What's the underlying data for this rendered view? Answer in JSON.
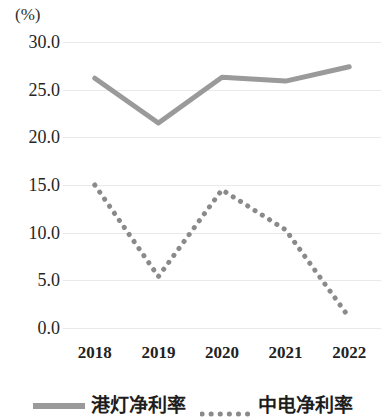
{
  "chart_data": {
    "type": "line",
    "title": "",
    "subtitle": "",
    "xlabel": "",
    "ylabel": "(%)",
    "unit_label": "(%)",
    "categories": [
      "2018",
      "2019",
      "2020",
      "2021",
      "2022"
    ],
    "x": [
      2018,
      2019,
      2020,
      2021,
      2022
    ],
    "ylim": [
      0.0,
      30.0
    ],
    "yticks": [
      "0.0",
      "5.0",
      "10.0",
      "15.0",
      "20.0",
      "25.0",
      "30.0"
    ],
    "ytick_values": [
      0.0,
      5.0,
      10.0,
      15.0,
      20.0,
      25.0,
      30.0
    ],
    "grid": true,
    "legend_position": "bottom",
    "series": [
      {
        "name": "港灯净利率",
        "style": "solid",
        "color": "#9a9a9a",
        "values": [
          26.2,
          21.5,
          26.3,
          25.9,
          27.4
        ]
      },
      {
        "name": "中电净利率",
        "style": "dotted",
        "color": "#8a8a8a",
        "values": [
          15.0,
          5.4,
          14.5,
          10.3,
          1.1
        ]
      }
    ]
  },
  "legend": {
    "items": [
      {
        "label": "港灯净利率",
        "style": "solid"
      },
      {
        "label": "中电净利率",
        "style": "dotted"
      }
    ]
  },
  "colors": {
    "series_solid": "#9a9a9a",
    "series_dotted": "#8a8a8a",
    "gridline": "#e9e9e9",
    "text": "#262626",
    "background": "#ffffff"
  }
}
